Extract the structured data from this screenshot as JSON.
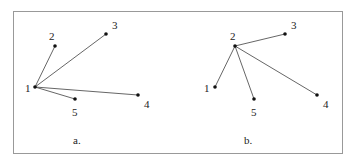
{
  "panels": [
    {
      "label": "a.",
      "label_pos": [
        73,
        144
      ],
      "nodes": [
        {
          "id": "1",
          "x": 35,
          "y": 87,
          "lx": 25,
          "ly": 92
        },
        {
          "id": "2",
          "x": 55,
          "y": 46,
          "lx": 49,
          "ly": 40
        },
        {
          "id": "3",
          "x": 106,
          "y": 34,
          "lx": 112,
          "ly": 29
        },
        {
          "id": "4",
          "x": 138,
          "y": 95,
          "lx": 144,
          "ly": 108
        },
        {
          "id": "5",
          "x": 75,
          "y": 99,
          "lx": 72,
          "ly": 116
        }
      ],
      "edges": [
        [
          "1",
          "2"
        ],
        [
          "1",
          "3"
        ],
        [
          "1",
          "4"
        ],
        [
          "1",
          "5"
        ]
      ]
    },
    {
      "label": "b.",
      "label_pos": [
        244,
        144
      ],
      "nodes": [
        {
          "id": "1",
          "x": 215,
          "y": 87,
          "lx": 204,
          "ly": 92
        },
        {
          "id": "2",
          "x": 235,
          "y": 46,
          "lx": 230,
          "ly": 40
        },
        {
          "id": "3",
          "x": 285,
          "y": 34,
          "lx": 291,
          "ly": 29
        },
        {
          "id": "4",
          "x": 317,
          "y": 95,
          "lx": 323,
          "ly": 108
        },
        {
          "id": "5",
          "x": 254,
          "y": 99,
          "lx": 251,
          "ly": 116
        }
      ],
      "edges": [
        [
          "2",
          "1"
        ],
        [
          "2",
          "3"
        ],
        [
          "2",
          "4"
        ],
        [
          "2",
          "5"
        ]
      ]
    }
  ],
  "frame": {
    "x": 13,
    "y": 11,
    "w": 329,
    "h": 142
  },
  "colors": {
    "line": "#555555",
    "node": "#111111",
    "frame": "#999999"
  }
}
